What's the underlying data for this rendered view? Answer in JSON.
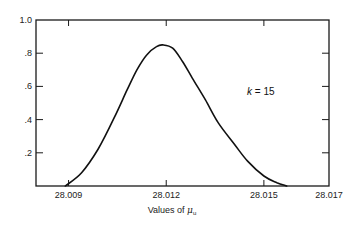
{
  "chart_data": {
    "type": "line",
    "title": "",
    "xlabel": "Values of μ_u",
    "ylabel": "",
    "xlim": [
      28.008,
      28.017
    ],
    "ylim": [
      0,
      1.0
    ],
    "grid": false,
    "legend": null,
    "x_ticks": [
      {
        "value": 28.009,
        "label": "28.009"
      },
      {
        "value": 28.012,
        "label": "28.012"
      },
      {
        "value": 28.015,
        "label": "28.015"
      },
      {
        "value": 28.017,
        "label": "28.017"
      }
    ],
    "y_ticks": [
      {
        "value": 0.2,
        "label": ".2"
      },
      {
        "value": 0.4,
        "label": ".4"
      },
      {
        "value": 0.6,
        "label": ".6"
      },
      {
        "value": 0.8,
        "label": ".8"
      },
      {
        "value": 1.0,
        "label": "1.0"
      }
    ],
    "annotations": [
      {
        "text_k": "k",
        "text_rest": " = 15",
        "x": 28.0134,
        "y": 0.6
      }
    ],
    "series": [
      {
        "name": "k = 15",
        "x": [
          28.0089,
          28.0094,
          28.0099,
          28.0104,
          28.0108,
          28.0111,
          28.0114,
          28.0117,
          28.0119,
          28.0122,
          28.0125,
          28.0128,
          28.0132,
          28.0136,
          28.0141,
          28.0145,
          28.015,
          28.0154,
          28.0157
        ],
        "values": [
          0.0,
          0.08,
          0.22,
          0.41,
          0.58,
          0.7,
          0.79,
          0.84,
          0.85,
          0.83,
          0.75,
          0.65,
          0.52,
          0.38,
          0.25,
          0.15,
          0.06,
          0.02,
          0.0
        ]
      }
    ]
  },
  "labels": {
    "xlabel_prefix": "Values of ",
    "xlabel_symbol": "μ",
    "xlabel_sub": "u",
    "annot_k": "k",
    "annot_rest": " = 15"
  }
}
